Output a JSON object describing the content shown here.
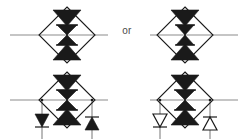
{
  "diagram": {
    "connector_label": "or",
    "colors": {
      "fill_dark": "#1a1a1a",
      "stroke_dark": "#1a1a1a",
      "stroke_light": "#8c8c8c",
      "fill_hollow": "#ffffff",
      "background": "#ffffff",
      "text": "#4a4a4a"
    },
    "stroke_widths": {
      "diamond": 1.1,
      "lead": 1.2,
      "axis": 1.3,
      "branch": 1.2,
      "hollow_triangle": 1.2
    },
    "symbols": [
      {
        "id": "symbol-top-left",
        "name": "top-left-symbol",
        "center_x": 67,
        "center_y": 35,
        "diamond_radius": 28,
        "lead_left_x": 10,
        "lead_right_x": 108,
        "has_branches": false,
        "branch_triangle_style": "none",
        "parts": {
          "diamond": "diamond-outline",
          "axis": "vertical-axis-line",
          "top_triangle": "filled-triangle-down",
          "bottom_triangle": "filled-triangle-up",
          "center": "filled-bowtie"
        }
      },
      {
        "id": "symbol-top-right",
        "name": "top-right-symbol",
        "center_x": 185,
        "center_y": 35,
        "diamond_radius": 28,
        "lead_left_x": 150,
        "lead_right_x": 238,
        "has_branches": false,
        "branch_triangle_style": "none",
        "parts": {
          "diamond": "diamond-outline",
          "axis": "vertical-axis-line",
          "top_triangle": "filled-triangle-down",
          "bottom_triangle": "filled-triangle-up",
          "center": "filled-bowtie"
        }
      },
      {
        "id": "symbol-bottom-left",
        "name": "bottom-left-symbol",
        "center_x": 67,
        "center_y": 100,
        "diamond_radius": 28,
        "lead_left_x": 10,
        "lead_right_x": 108,
        "has_branches": true,
        "branch_triangle_style": "filled",
        "branch_left_x": 42,
        "branch_right_x": 92,
        "branch_bottom_y": 139,
        "branch_left_triangle": "filled-triangle-down",
        "branch_right_triangle": "filled-triangle-up",
        "parts": {
          "diamond": "diamond-outline",
          "axis": "vertical-axis-line",
          "top_triangle": "filled-triangle-down",
          "bottom_triangle": "filled-triangle-up",
          "center": "filled-bowtie"
        }
      },
      {
        "id": "symbol-bottom-right",
        "name": "bottom-right-symbol",
        "center_x": 185,
        "center_y": 100,
        "diamond_radius": 28,
        "lead_left_x": 150,
        "lead_right_x": 238,
        "has_branches": true,
        "branch_triangle_style": "hollow",
        "branch_left_x": 160,
        "branch_right_x": 210,
        "branch_bottom_y": 139,
        "branch_left_triangle": "hollow-triangle-down",
        "branch_right_triangle": "hollow-triangle-up",
        "parts": {
          "diamond": "diamond-outline",
          "axis": "vertical-axis-line",
          "top_triangle": "filled-triangle-down",
          "bottom_triangle": "filled-triangle-up",
          "center": "filled-bowtie"
        }
      }
    ]
  }
}
